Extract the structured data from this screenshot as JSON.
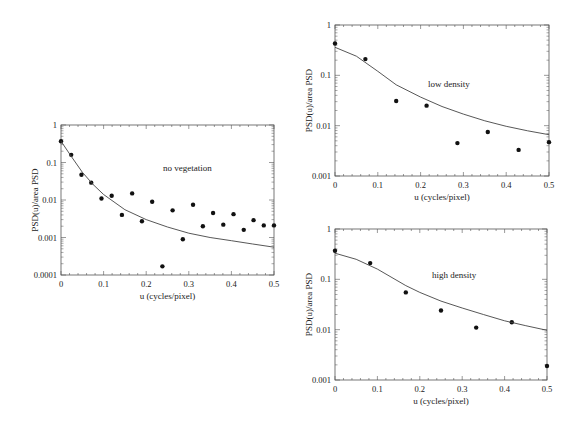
{
  "chart_data": [
    {
      "id": "no-vegetation",
      "type": "scatter",
      "title": "",
      "annotation": "no vegetation",
      "xlabel": "u (cycles/pixel)",
      "ylabel": "PSD(u)/area PSD",
      "xlim": [
        0,
        0.5
      ],
      "ylim": [
        0.0001,
        1
      ],
      "yscale": "log",
      "x_ticks": [
        "0",
        "0.1",
        "0.2",
        "0.3",
        "0.4",
        "0.5"
      ],
      "y_ticks": [
        "1",
        "0.1",
        "0.01",
        "0.001",
        "0.0001"
      ],
      "grid": false,
      "series": [
        {
          "name": "measured",
          "style": "points",
          "x": [
            0,
            0.024,
            0.048,
            0.071,
            0.095,
            0.119,
            0.143,
            0.167,
            0.19,
            0.214,
            0.238,
            0.262,
            0.286,
            0.31,
            0.333,
            0.357,
            0.381,
            0.405,
            0.429,
            0.452,
            0.476,
            0.5
          ],
          "y": [
            0.37,
            0.16,
            0.047,
            0.029,
            0.011,
            0.013,
            0.004,
            0.015,
            0.0027,
            0.009,
            0.00017,
            0.0053,
            0.0009,
            0.0075,
            0.002,
            0.0045,
            0.0022,
            0.0042,
            0.0016,
            0.0029,
            0.0021,
            0.0021
          ]
        },
        {
          "name": "model",
          "style": "line",
          "x": [
            0,
            0.025,
            0.05,
            0.075,
            0.1,
            0.15,
            0.2,
            0.25,
            0.3,
            0.35,
            0.4,
            0.45,
            0.5
          ],
          "y": [
            0.37,
            0.14,
            0.055,
            0.026,
            0.014,
            0.0055,
            0.003,
            0.0019,
            0.0013,
            0.001,
            0.00082,
            0.00067,
            0.00055
          ]
        }
      ]
    },
    {
      "id": "low-density",
      "type": "scatter",
      "title": "",
      "annotation": "low density",
      "xlabel": "u (cycles/pixel)",
      "ylabel": "PSD(u)/area PSD",
      "xlim": [
        0,
        0.5
      ],
      "ylim": [
        0.001,
        1
      ],
      "yscale": "log",
      "x_ticks": [
        "0",
        "0.1",
        "0.2",
        "0.3",
        "0.4",
        "0.5"
      ],
      "y_ticks": [
        "1",
        "0.1",
        "0.01",
        "0.001"
      ],
      "grid": false,
      "series": [
        {
          "name": "measured",
          "style": "points",
          "x": [
            0,
            0.071,
            0.143,
            0.214,
            0.286,
            0.357,
            0.429,
            0.5
          ],
          "y": [
            0.43,
            0.21,
            0.031,
            0.025,
            0.0045,
            0.0075,
            0.0033,
            0.0047
          ]
        },
        {
          "name": "model",
          "style": "line",
          "x": [
            0,
            0.05,
            0.1,
            0.143,
            0.2,
            0.25,
            0.3,
            0.35,
            0.4,
            0.45,
            0.5
          ],
          "y": [
            0.36,
            0.24,
            0.12,
            0.065,
            0.037,
            0.024,
            0.017,
            0.0125,
            0.0097,
            0.0079,
            0.0066
          ]
        }
      ]
    },
    {
      "id": "high-density",
      "type": "scatter",
      "title": "",
      "annotation": "high density",
      "xlabel": "u (cycles/pixel)",
      "ylabel": "PSD(u)/area PSD",
      "xlim": [
        0,
        0.5
      ],
      "ylim": [
        0.001,
        1
      ],
      "yscale": "log",
      "x_ticks": [
        "0",
        "0.1",
        "0.2",
        "0.3",
        "0.4",
        "0.5"
      ],
      "y_ticks": [
        "1",
        "0.1",
        "0.01",
        "0.001"
      ],
      "grid": false,
      "series": [
        {
          "name": "measured",
          "style": "points",
          "x": [
            0,
            0.083,
            0.167,
            0.25,
            0.333,
            0.417,
            0.5
          ],
          "y": [
            0.37,
            0.21,
            0.055,
            0.024,
            0.011,
            0.014,
            0.0019
          ]
        },
        {
          "name": "model",
          "style": "line",
          "x": [
            0,
            0.05,
            0.1,
            0.167,
            0.2,
            0.25,
            0.3,
            0.35,
            0.4,
            0.45,
            0.5
          ],
          "y": [
            0.33,
            0.25,
            0.16,
            0.075,
            0.055,
            0.037,
            0.027,
            0.02,
            0.015,
            0.012,
            0.0097
          ]
        }
      ]
    }
  ],
  "layout": {
    "panels": [
      {
        "left": 61,
        "top": 125,
        "right": 274,
        "bottom": 275,
        "ylabel_x": 38,
        "annot_x": 163,
        "annot_y": 171
      },
      {
        "left": 335,
        "top": 25,
        "right": 549,
        "bottom": 176,
        "ylabel_x": 312,
        "annot_x": 428,
        "annot_y": 87
      },
      {
        "left": 335,
        "top": 229,
        "right": 547,
        "bottom": 380,
        "ylabel_x": 312,
        "annot_x": 432,
        "annot_y": 278
      }
    ],
    "colors": {
      "axis": "#555555",
      "points": "#111111",
      "line": "#444444"
    }
  }
}
